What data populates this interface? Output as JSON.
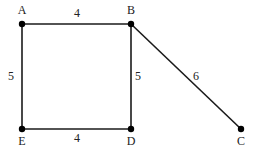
{
  "graph": {
    "nodes": [
      {
        "id": "A",
        "label": "A",
        "x": 22,
        "y": 24,
        "lx": 22,
        "ly": 14
      },
      {
        "id": "B",
        "label": "B",
        "x": 131,
        "y": 24,
        "lx": 131,
        "ly": 14
      },
      {
        "id": "C",
        "label": "C",
        "x": 241,
        "y": 129,
        "lx": 241,
        "ly": 145
      },
      {
        "id": "D",
        "label": "D",
        "x": 131,
        "y": 129,
        "lx": 131,
        "ly": 145
      },
      {
        "id": "E",
        "label": "E",
        "x": 22,
        "y": 129,
        "lx": 22,
        "ly": 145
      }
    ],
    "edges": [
      {
        "from": "A",
        "to": "B",
        "weight": "4",
        "lx": 77,
        "ly": 17
      },
      {
        "from": "A",
        "to": "E",
        "weight": "5",
        "lx": 11,
        "ly": 80
      },
      {
        "from": "B",
        "to": "D",
        "weight": "5",
        "lx": 138,
        "ly": 80
      },
      {
        "from": "E",
        "to": "D",
        "weight": "4",
        "lx": 77,
        "ly": 142
      },
      {
        "from": "B",
        "to": "C",
        "weight": "6",
        "lx": 196,
        "ly": 80
      }
    ]
  }
}
